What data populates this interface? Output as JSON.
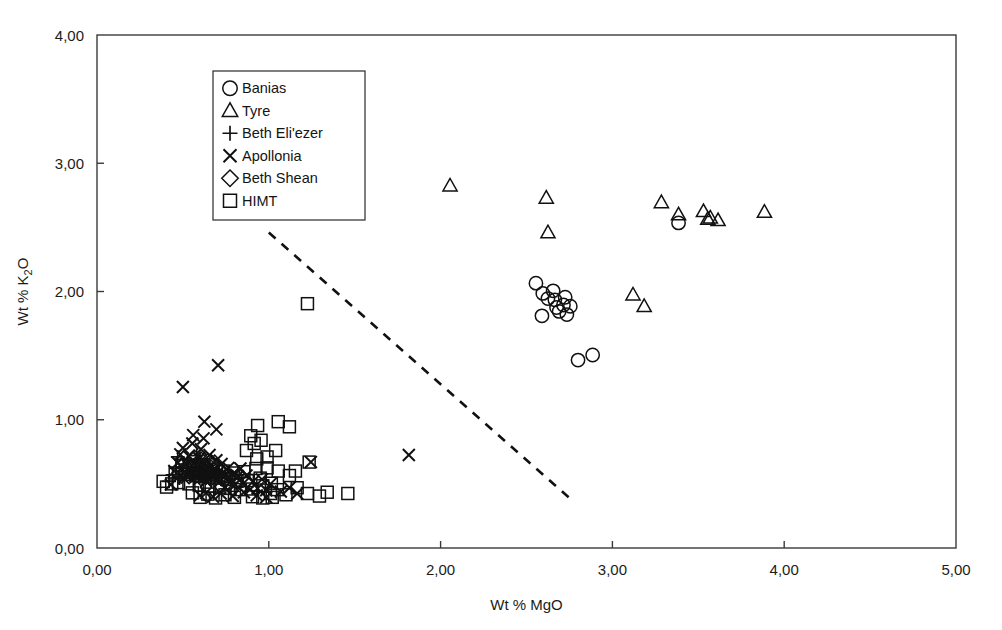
{
  "chart_data": {
    "type": "scatter",
    "title": "",
    "xlabel": "Wt % MgO",
    "ylabel": "Wt % K2O",
    "ylabel_main": "Wt % K",
    "ylabel_subscript": "2",
    "ylabel_tail": "O",
    "xlim": [
      0,
      5
    ],
    "ylim": [
      0,
      4
    ],
    "xticks": [
      0,
      1,
      2,
      3,
      4,
      5
    ],
    "yticks": [
      0,
      1,
      2,
      3,
      4
    ],
    "xticklabels": [
      "0,00",
      "1,00",
      "2,00",
      "3,00",
      "4,00",
      "5,00"
    ],
    "yticklabels": [
      "0,00",
      "1,00",
      "2,00",
      "3,00",
      "4,00"
    ],
    "grid": false,
    "decimal_separator": ",",
    "legend_position": "upper-left-inside",
    "annotations": [
      {
        "name": "compositional-divider",
        "type": "dashed-line",
        "x1": 1.0,
        "y1": 2.46,
        "x2": 2.75,
        "y2": 0.39
      }
    ],
    "series": [
      {
        "name": "Banias",
        "marker": "circle",
        "points": [
          [
            2.555,
            2.065
          ],
          [
            2.595,
            1.985
          ],
          [
            2.625,
            1.945
          ],
          [
            2.655,
            2.005
          ],
          [
            2.665,
            1.935
          ],
          [
            2.675,
            1.875
          ],
          [
            2.69,
            1.845
          ],
          [
            2.715,
            1.895
          ],
          [
            2.725,
            1.955
          ],
          [
            2.735,
            1.82
          ],
          [
            2.755,
            1.885
          ],
          [
            2.59,
            1.81
          ],
          [
            2.8,
            1.465
          ],
          [
            2.885,
            1.505
          ],
          [
            3.385,
            2.535
          ]
        ]
      },
      {
        "name": "Tyre",
        "marker": "triangle",
        "points": [
          [
            2.055,
            2.825
          ],
          [
            2.615,
            2.73
          ],
          [
            2.625,
            2.46
          ],
          [
            3.12,
            1.975
          ],
          [
            3.185,
            1.885
          ],
          [
            3.285,
            2.695
          ],
          [
            3.385,
            2.6
          ],
          [
            3.53,
            2.625
          ],
          [
            3.555,
            2.565
          ],
          [
            3.57,
            2.575
          ],
          [
            3.615,
            2.555
          ],
          [
            3.885,
            2.62
          ]
        ]
      },
      {
        "name": "Beth Eli'ezer",
        "marker": "plus",
        "points": [
          [
            0.44,
            0.57
          ],
          [
            0.46,
            0.62
          ],
          [
            0.48,
            0.545
          ],
          [
            0.5,
            0.6
          ],
          [
            0.505,
            0.655
          ],
          [
            0.52,
            0.575
          ],
          [
            0.53,
            0.625
          ],
          [
            0.545,
            0.565
          ],
          [
            0.555,
            0.6
          ],
          [
            0.565,
            0.545
          ],
          [
            0.575,
            0.635
          ],
          [
            0.585,
            0.585
          ],
          [
            0.595,
            0.555
          ],
          [
            0.605,
            0.615
          ],
          [
            0.615,
            0.565
          ],
          [
            0.625,
            0.6
          ],
          [
            0.635,
            0.545
          ],
          [
            0.645,
            0.585
          ],
          [
            0.655,
            0.62
          ],
          [
            0.665,
            0.555
          ],
          [
            0.675,
            0.595
          ],
          [
            0.685,
            0.56
          ],
          [
            0.695,
            0.6
          ],
          [
            0.705,
            0.575
          ],
          [
            0.72,
            0.545
          ],
          [
            0.73,
            0.59
          ],
          [
            0.58,
            0.72
          ],
          [
            0.6,
            0.695
          ],
          [
            0.42,
            0.52
          ],
          [
            0.47,
            0.71
          ]
        ]
      },
      {
        "name": "Apollonia",
        "marker": "cross",
        "points": [
          [
            0.5,
            1.255
          ],
          [
            0.705,
            1.425
          ],
          [
            0.625,
            0.985
          ],
          [
            0.695,
            0.925
          ],
          [
            0.43,
            0.495
          ],
          [
            0.45,
            0.6
          ],
          [
            0.47,
            0.665
          ],
          [
            0.485,
            0.73
          ],
          [
            0.5,
            0.78
          ],
          [
            0.505,
            0.545
          ],
          [
            0.52,
            0.655
          ],
          [
            0.535,
            0.715
          ],
          [
            0.545,
            0.605
          ],
          [
            0.555,
            0.815
          ],
          [
            0.565,
            0.665
          ],
          [
            0.575,
            0.555
          ],
          [
            0.585,
            0.63
          ],
          [
            0.595,
            0.7
          ],
          [
            0.605,
            0.77
          ],
          [
            0.615,
            0.595
          ],
          [
            0.625,
            0.66
          ],
          [
            0.635,
            0.52
          ],
          [
            0.645,
            0.585
          ],
          [
            0.655,
            0.725
          ],
          [
            0.665,
            0.645
          ],
          [
            0.675,
            0.555
          ],
          [
            0.685,
            0.62
          ],
          [
            0.695,
            0.685
          ],
          [
            0.705,
            0.59
          ],
          [
            0.715,
            0.52
          ],
          [
            0.725,
            0.655
          ],
          [
            0.735,
            0.585
          ],
          [
            0.745,
            0.475
          ],
          [
            0.755,
            0.545
          ],
          [
            0.765,
            0.625
          ],
          [
            0.775,
            0.51
          ],
          [
            0.79,
            0.575
          ],
          [
            0.805,
            0.495
          ],
          [
            0.82,
            0.56
          ],
          [
            0.835,
            0.62
          ],
          [
            0.85,
            0.5
          ],
          [
            0.87,
            0.565
          ],
          [
            0.89,
            0.455
          ],
          [
            0.91,
            0.52
          ],
          [
            0.935,
            0.465
          ],
          [
            0.96,
            0.535
          ],
          [
            0.985,
            0.45
          ],
          [
            1.01,
            0.5
          ],
          [
            0.6,
            0.41
          ],
          [
            0.635,
            0.43
          ],
          [
            0.675,
            0.4
          ],
          [
            0.72,
            0.425
          ],
          [
            0.79,
            0.405
          ],
          [
            0.855,
            0.435
          ],
          [
            0.62,
            0.855
          ],
          [
            0.56,
            0.88
          ],
          [
            1.245,
            0.67
          ],
          [
            1.815,
            0.725
          ],
          [
            1.07,
            0.44
          ],
          [
            1.12,
            0.47
          ],
          [
            1.165,
            0.425
          ],
          [
            0.985,
            0.395
          ],
          [
            0.93,
            0.41
          ]
        ]
      },
      {
        "name": "Beth Shean",
        "marker": "diamond",
        "points": [
          [
            0.565,
            0.705
          ],
          [
            0.585,
            0.655
          ],
          [
            0.605,
            0.69
          ],
          [
            0.625,
            0.635
          ],
          [
            0.645,
            0.675
          ],
          [
            0.665,
            0.625
          ],
          [
            0.685,
            0.665
          ],
          [
            0.705,
            0.615
          ],
          [
            0.52,
            0.63
          ],
          [
            0.545,
            0.585
          ],
          [
            0.575,
            0.565
          ],
          [
            0.605,
            0.545
          ],
          [
            0.635,
            0.59
          ],
          [
            0.665,
            0.545
          ],
          [
            0.695,
            0.575
          ],
          [
            0.725,
            0.545
          ],
          [
            0.49,
            0.565
          ],
          [
            0.755,
            0.51
          ],
          [
            0.78,
            0.555
          ],
          [
            0.81,
            0.52
          ]
        ]
      },
      {
        "name": "HIMT",
        "marker": "square",
        "points": [
          [
            1.055,
            0.985
          ],
          [
            1.12,
            0.945
          ],
          [
            0.935,
            0.955
          ],
          [
            0.895,
            0.875
          ],
          [
            1.225,
            1.905
          ],
          [
            1.235,
            0.67
          ],
          [
            1.46,
            0.425
          ],
          [
            1.295,
            0.405
          ],
          [
            1.34,
            0.435
          ],
          [
            1.225,
            0.425
          ],
          [
            1.165,
            0.47
          ],
          [
            1.1,
            0.415
          ],
          [
            1.05,
            0.455
          ],
          [
            1.015,
            0.505
          ],
          [
            1.01,
            0.425
          ],
          [
            0.965,
            0.485
          ],
          [
            0.95,
            0.545
          ],
          [
            0.925,
            0.62
          ],
          [
            0.9,
            0.46
          ],
          [
            0.875,
            0.525
          ],
          [
            0.855,
            0.595
          ],
          [
            0.835,
            0.455
          ],
          [
            0.815,
            0.52
          ],
          [
            0.795,
            0.585
          ],
          [
            0.775,
            0.465
          ],
          [
            0.755,
            0.535
          ],
          [
            0.735,
            0.6
          ],
          [
            0.715,
            0.47
          ],
          [
            0.695,
            0.545
          ],
          [
            0.675,
            0.615
          ],
          [
            0.655,
            0.48
          ],
          [
            0.635,
            0.555
          ],
          [
            0.615,
            0.625
          ],
          [
            0.595,
            0.49
          ],
          [
            0.575,
            0.565
          ],
          [
            0.555,
            0.635
          ],
          [
            0.535,
            0.5
          ],
          [
            0.515,
            0.575
          ],
          [
            0.495,
            0.645
          ],
          [
            0.475,
            0.51
          ],
          [
            0.455,
            0.585
          ],
          [
            0.435,
            0.5
          ],
          [
            0.405,
            0.475
          ],
          [
            0.385,
            0.52
          ],
          [
            0.93,
            0.695
          ],
          [
            0.99,
            0.71
          ],
          [
            1.04,
            0.76
          ],
          [
            0.87,
            0.76
          ],
          [
            0.905,
            0.4
          ],
          [
            0.965,
            0.39
          ],
          [
            1.02,
            0.395
          ],
          [
            0.8,
            0.395
          ],
          [
            0.745,
            0.415
          ],
          [
            0.69,
            0.39
          ],
          [
            0.645,
            0.42
          ],
          [
            0.6,
            0.395
          ],
          [
            0.555,
            0.43
          ],
          [
            0.915,
            0.815
          ],
          [
            0.955,
            0.84
          ],
          [
            0.99,
            0.625
          ],
          [
            1.055,
            0.6
          ],
          [
            1.12,
            0.565
          ],
          [
            1.155,
            0.6
          ]
        ]
      }
    ]
  },
  "legend": {
    "entries": [
      {
        "label": "Banias",
        "marker": "circle"
      },
      {
        "label": "Tyre",
        "marker": "triangle"
      },
      {
        "label": "Beth Eli'ezer",
        "marker": "plus"
      },
      {
        "label": "Apollonia",
        "marker": "cross"
      },
      {
        "label": "Beth Shean",
        "marker": "diamond"
      },
      {
        "label": "HIMT",
        "marker": "square"
      }
    ]
  },
  "colors": {
    "marker_stroke": "#111111",
    "axis": "#3a3a3a",
    "background": "#ffffff",
    "divider": "#111111"
  }
}
